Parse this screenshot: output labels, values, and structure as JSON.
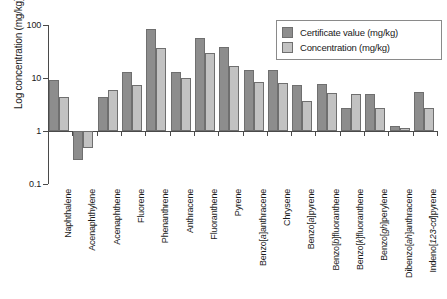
{
  "chart_data": {
    "type": "bar",
    "title": "",
    "xlabel": "",
    "ylabel": "Log concentration (mg/kg)",
    "yscale": "log",
    "ylim": [
      0.1,
      100
    ],
    "ytick_labels": [
      "100",
      "10",
      "1",
      "0.1"
    ],
    "ytick_values": [
      100,
      10,
      1,
      0.1
    ],
    "grid": false,
    "legend_position": "top-right",
    "baseline_value": 1,
    "categories": [
      "Naphthalene",
      "Acenaphthylene",
      "Acenaphthene",
      "Fluorene",
      "Phenanthrene",
      "Anthracene",
      "Fluoranthene",
      "Pyrene",
      "Benzo[a]anthracene",
      "Chrysene",
      "Benzo[a]pyrene",
      "Benzo[b]fluoranthene",
      "Benzo[k]fluoranthene",
      "Benzo[gh]perylene",
      "Dibenzo[ah]anthracene",
      "Indeno[123-cd]pyrene"
    ],
    "series": [
      {
        "name": "Certificate value (mg/kg)",
        "color": "#8d8d8d",
        "values": [
          9.2,
          0.28,
          4.4,
          13.0,
          85.0,
          12.8,
          57.0,
          39.0,
          14.2,
          14.3,
          7.4,
          7.8,
          2.7,
          4.9,
          1.25,
          5.4
        ]
      },
      {
        "name": "Concentration (mg/kg)",
        "color": "#c2c2c2",
        "values": [
          4.4,
          0.48,
          5.9,
          7.5,
          37.0,
          9.9,
          30.0,
          16.5,
          8.5,
          8.1,
          3.7,
          5.3,
          4.9,
          2.7,
          1.15,
          2.7
        ]
      }
    ]
  },
  "axis": {
    "y_title": "Log concentration (mg/kg)"
  },
  "legend": {
    "items": [
      {
        "label": "Certificate value (mg/kg)",
        "swatch": "cert"
      },
      {
        "label": "Concentration (mg/kg)",
        "swatch": "conc"
      }
    ]
  }
}
